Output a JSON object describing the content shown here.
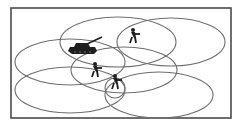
{
  "diagram": {
    "colors": {
      "background": "#ffffff",
      "border": "#4a4a4a",
      "ellipse_stroke": "#6e6e6e",
      "figure_fill": "#1e1e1e"
    },
    "frame": {
      "x": 11,
      "y": 8,
      "width": 220,
      "height": 110
    },
    "ellipses": [
      {
        "name": "ellipse-top-middle",
        "cx": 118,
        "cy": 42,
        "rx": 58,
        "ry": 25
      },
      {
        "name": "ellipse-top-right",
        "cx": 171,
        "cy": 42,
        "rx": 54,
        "ry": 24
      },
      {
        "name": "ellipse-middle-left",
        "cx": 70,
        "cy": 62,
        "rx": 55,
        "ry": 23
      },
      {
        "name": "ellipse-center",
        "cx": 124,
        "cy": 70,
        "rx": 53,
        "ry": 23
      },
      {
        "name": "ellipse-bottom-left",
        "cx": 70,
        "cy": 90,
        "rx": 55,
        "ry": 23
      },
      {
        "name": "ellipse-bottom-right",
        "cx": 159,
        "cy": 95,
        "rx": 54,
        "ry": 23
      },
      {
        "name": "ellipse-small",
        "cx": 115,
        "cy": 88,
        "rx": 10,
        "ry": 10
      }
    ],
    "units": [
      {
        "type": "tank",
        "icon": "tank-icon",
        "x": 68,
        "y": 38
      },
      {
        "type": "soldier",
        "icon": "soldier-icon",
        "x": 128,
        "y": 28
      },
      {
        "type": "soldier",
        "icon": "soldier-icon",
        "x": 90,
        "y": 62
      },
      {
        "type": "soldier",
        "icon": "soldier-icon",
        "x": 110,
        "y": 74
      }
    ]
  }
}
